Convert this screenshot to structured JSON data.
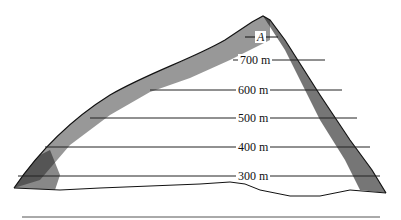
{
  "figure": {
    "type": "mountain cross-section with contour elevation lines",
    "point_label": "A",
    "contours": [
      {
        "label": "700 m",
        "y": 60,
        "x1": 233,
        "x2": 325,
        "lx": 238
      },
      {
        "label": "600 m",
        "y": 90,
        "x1": 150,
        "x2": 342,
        "lx": 236
      },
      {
        "label": "500 m",
        "y": 118,
        "x1": 90,
        "x2": 357,
        "lx": 236
      },
      {
        "label": "400 m",
        "y": 147,
        "x1": 45,
        "x2": 370,
        "lx": 236
      },
      {
        "label": "300 m",
        "y": 176,
        "x1": 18,
        "x2": 380,
        "lx": 236
      }
    ],
    "colors": {
      "ink": "#111111",
      "background": "#ffffff"
    }
  }
}
